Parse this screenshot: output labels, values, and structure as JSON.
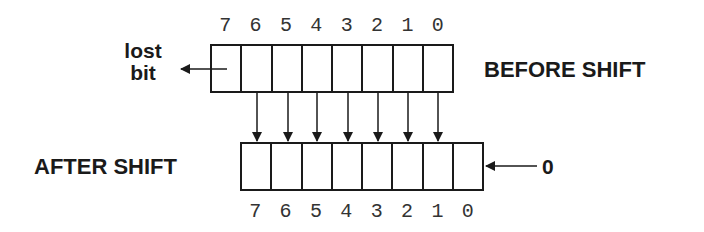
{
  "diagram": {
    "before_label": "BEFORE SHIFT",
    "after_label": "AFTER SHIFT",
    "lost_bit_label_line1": "lost",
    "lost_bit_label_line2": "bit",
    "shift_in_value": "0",
    "top_bit_numbers": [
      "7",
      "6",
      "5",
      "4",
      "3",
      "2",
      "1",
      "0"
    ],
    "bottom_bit_numbers": [
      "7",
      "6",
      "5",
      "4",
      "3",
      "2",
      "1",
      "0"
    ],
    "colors": {
      "line": "#1a1a1a",
      "text": "#1a1a1a",
      "bit_number": "#333333",
      "background": "#ffffff"
    }
  }
}
